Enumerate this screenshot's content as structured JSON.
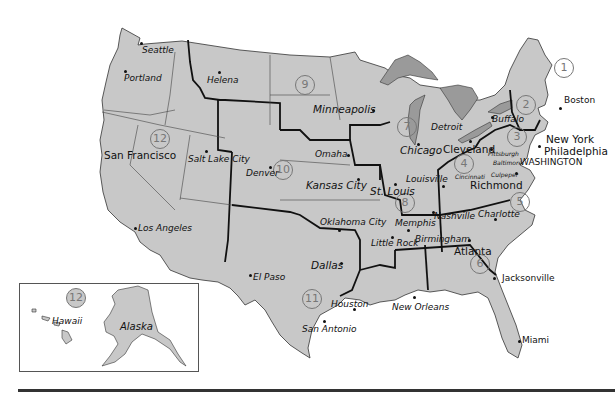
{
  "map": {
    "title": "Federal Reserve Districts",
    "fill_color": "#c8c8c8",
    "lake_color": "#9a9a9a",
    "boundary_color": "#111111",
    "districts": [
      {
        "n": "1",
        "x": 776,
        "y": 0
      },
      {
        "n": "1",
        "x": 516,
        "y": 90
      },
      {
        "n": "2",
        "x": 546,
        "y": 123
      },
      {
        "n": "3",
        "x": 517,
        "y": 153
      },
      {
        "n": "4",
        "x": 424,
        "y": 174
      },
      {
        "n": "5",
        "x": 516,
        "y": 223
      },
      {
        "n": "6",
        "x": 472,
        "y": 257
      },
      {
        "n": "7",
        "x": 338,
        "y": 135
      },
      {
        "n": "8",
        "x": 392,
        "y": 232
      },
      {
        "n": "9",
        "x": 285,
        "y": 85
      },
      {
        "n": "10",
        "x": 277,
        "y": 165
      },
      {
        "n": "11",
        "x": 301,
        "y": 315
      },
      {
        "n": "12",
        "x": 152,
        "y": 138
      },
      {
        "n": "12",
        "x": 64,
        "y": 285
      }
    ],
    "cities": {
      "seattle": "Seattle",
      "portland": "Portland",
      "helena": "Helena",
      "san_francisco": "San Francisco",
      "salt_lake_city": "Salt Lake City",
      "denver": "Denver",
      "los_angeles": "Los Angeles",
      "el_paso": "El Paso",
      "minneapolis": "Minneapolis",
      "omaha": "Omaha",
      "kansas_city": "Kansas City",
      "chicago": "Chicago",
      "detroit": "Detroit",
      "st_louis": "St. Louis",
      "louisville": "Louisville",
      "cleveland": "Cleveland",
      "cincinnati": "Cincinnati",
      "pittsburgh": "Pittsburgh",
      "baltimore": "Baltimore",
      "culpeper": "Culpeper",
      "richmond": "Richmond",
      "washington": "WASHINGTON",
      "buffalo": "Buffalo",
      "boston": "Boston",
      "new_york": "New York",
      "philadelphia": "Philadelphia",
      "oklahoma_city": "Oklahoma City",
      "memphis": "Memphis",
      "nashville": "Nashville",
      "charlotte": "Charlotte",
      "little_rock": "Little Rock",
      "birmingham": "Birmingham",
      "atlanta": "Atlanta",
      "dallas": "Dallas",
      "jacksonville": "Jacksonville",
      "houston": "Houston",
      "new_orleans": "New Orleans",
      "san_antonio": "San Antonio",
      "miami": "Miami",
      "hawaii": "Hawaii",
      "alaska": "Alaska"
    }
  }
}
